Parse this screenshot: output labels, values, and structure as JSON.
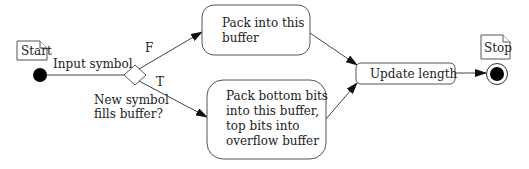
{
  "diagram": {
    "type": "activity",
    "start_note": "Start",
    "stop_note": "Stop",
    "input_label": "Input symbol",
    "decision": {
      "label_line1": "New symbol",
      "label_line2": "fills buffer?",
      "false_label": "F",
      "true_label": "T"
    },
    "actions": {
      "pack": {
        "line1": "Pack into this",
        "line2": "buffer"
      },
      "pack_overflow": {
        "line1": "Pack bottom bits",
        "line2": "into this buffer,",
        "line3": "top bits into",
        "line4": "overflow buffer"
      },
      "update": {
        "label": "Update length"
      }
    }
  }
}
